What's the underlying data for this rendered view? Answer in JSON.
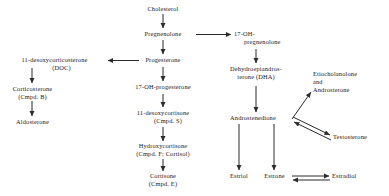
{
  "diagram": {
    "nodes": [
      {
        "id": "cholesterol",
        "lines": [
          "Cholesterol"
        ]
      },
      {
        "id": "pregnenolone",
        "lines": [
          "Pregnenolone"
        ]
      },
      {
        "id": "progesterone",
        "lines": [
          "Progesterone"
        ]
      },
      {
        "id": "desoxycorticosterone",
        "lines": [
          "11-desoxycorticosterone",
          "(DOC)"
        ]
      },
      {
        "id": "corticosterone",
        "lines": [
          "Corticosterone",
          "(Cmpd. B)"
        ]
      },
      {
        "id": "aldosterone",
        "lines": [
          "Aldosterone"
        ]
      },
      {
        "id": "oh-progesterone",
        "lines": [
          "17-OH-progesterone"
        ]
      },
      {
        "id": "desoxycortisone",
        "lines": [
          "11-desoxycortisone",
          "(Cmpd. S)"
        ]
      },
      {
        "id": "hydroxycortisone",
        "lines": [
          "Hydroxycortisone",
          "(Cmpd. F; Cortisol)"
        ]
      },
      {
        "id": "cortisone",
        "lines": [
          "Cortisone",
          "(Cmpd. E)"
        ]
      },
      {
        "id": "oh-pregnenolone",
        "lines": [
          "17-OH-",
          "pregnenolone"
        ]
      },
      {
        "id": "dha",
        "lines": [
          "Dehydroepiandros-",
          "terone (DHA)"
        ]
      },
      {
        "id": "etiocholanolone",
        "lines": [
          "Etiocholanolone",
          "and",
          "Androsterone"
        ]
      },
      {
        "id": "androstenedione",
        "lines": [
          "Androstenedione"
        ]
      },
      {
        "id": "testosterone",
        "lines": [
          "Testosterone"
        ]
      },
      {
        "id": "estriol",
        "lines": [
          "Estriol"
        ]
      },
      {
        "id": "estrone",
        "lines": [
          "Estrone"
        ]
      },
      {
        "id": "estradiol",
        "lines": [
          "Estradiol"
        ]
      }
    ],
    "edges": [
      {
        "from": "cholesterol",
        "to": "pregenolone-down",
        "kind": "single"
      },
      {
        "from": "pregnenolone",
        "to": "progesterone",
        "kind": "single"
      },
      {
        "from": "pregnenolone",
        "to": "oh-pregnenolone",
        "kind": "single"
      },
      {
        "from": "progesterone",
        "to": "desoxycorticosterone",
        "kind": "single"
      },
      {
        "from": "progesterone",
        "to": "oh-progesterone",
        "kind": "single"
      },
      {
        "from": "desoxycorticosterone",
        "to": "corticosterone",
        "kind": "single"
      },
      {
        "from": "corticosterone",
        "to": "aldosterone",
        "kind": "single"
      },
      {
        "from": "oh-progesterone",
        "to": "desoxycortisone",
        "kind": "single"
      },
      {
        "from": "desoxycortisone",
        "to": "hydroxycortisone",
        "kind": "single"
      },
      {
        "from": "hydroxycortisone",
        "to": "cortisone",
        "kind": "single"
      },
      {
        "from": "oh-pregnenolone",
        "to": "dha",
        "kind": "single"
      },
      {
        "from": "dha",
        "to": "androstenedione",
        "kind": "single"
      },
      {
        "from": "androstenedione",
        "to": "etiocholanolone",
        "kind": "single"
      },
      {
        "from": "androstenedione",
        "to": "testosterone",
        "kind": "double"
      },
      {
        "from": "androstenedione",
        "to": "estriol",
        "kind": "single"
      },
      {
        "from": "androstenedione",
        "to": "estrone",
        "kind": "single"
      },
      {
        "from": "estrone",
        "to": "estradiol",
        "kind": "double"
      }
    ],
    "colors": {
      "text": "#1a1a1a",
      "line": "#2b2b2b",
      "background": "#ffffff"
    }
  }
}
